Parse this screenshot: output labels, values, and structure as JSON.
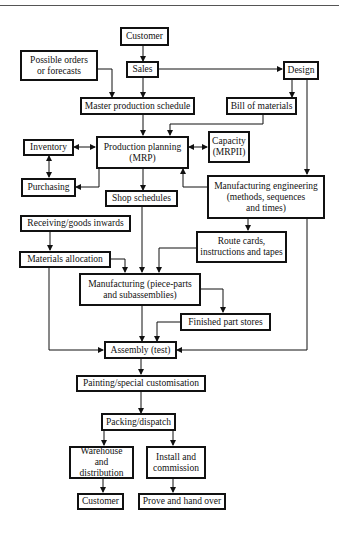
{
  "header": {
    "running_head": "…"
  },
  "diagram": {
    "nodes": {
      "customer_top": "Customer",
      "possible_orders": "Possible orders\nor forecasts",
      "sales": "Sales",
      "design": "Design",
      "master_schedule": "Master production schedule",
      "bill_of_materials": "Bill of materials",
      "inventory": "Inventory",
      "production_planning": "Production planning\n(MRP)",
      "capacity": "Capacity\n(MRPII)",
      "purchasing": "Purchasing",
      "shop_schedules": "Shop schedules",
      "mfg_engineering": "Manufacturing engineering\n(methods, sequences\nand times)",
      "receiving": "Receiving/goods inwards",
      "route_cards": "Route cards,\ninstructions and tapes",
      "materials_allocation": "Materials allocation",
      "manufacturing": "Manufacturing (piece-parts\nand subassemblies)",
      "finished_part_stores": "Finished part stores",
      "assembly": "Assembly (test)",
      "painting": "Painting/special customisation",
      "packing": "Packing/dispatch",
      "warehouse": "Warehouse and\ndistribution",
      "install": "Install and\ncommission",
      "customer_bottom": "Customer",
      "prove": "Prove and hand over"
    },
    "edges": [
      [
        "Customer",
        "Sales"
      ],
      [
        "Sales",
        "Design"
      ],
      [
        "Sales",
        "Master production schedule"
      ],
      [
        "Possible orders or forecasts",
        "Master production schedule"
      ],
      [
        "Design",
        "Bill of materials"
      ],
      [
        "Master production schedule",
        "Production planning (MRP)"
      ],
      [
        "Bill of materials",
        "Production planning (MRP)"
      ],
      [
        "Inventory",
        "Production planning (MRP)",
        "bidirectional"
      ],
      [
        "Production planning (MRP)",
        "Capacity (MRPII)",
        "bidirectional"
      ],
      [
        "Inventory",
        "Purchasing",
        "bidirectional"
      ],
      [
        "Production planning (MRP)",
        "Purchasing"
      ],
      [
        "Production planning (MRP)",
        "Shop schedules"
      ],
      [
        "Manufacturing engineering",
        "Production planning (MRP)"
      ],
      [
        "Design",
        "Manufacturing engineering"
      ],
      [
        "Manufacturing engineering",
        "Route cards"
      ],
      [
        "Receiving/goods inwards",
        "Materials allocation"
      ],
      [
        "Materials allocation",
        "Manufacturing"
      ],
      [
        "Shop schedules",
        "Manufacturing"
      ],
      [
        "Route cards",
        "Manufacturing"
      ],
      [
        "Manufacturing",
        "Finished part stores"
      ],
      [
        "Manufacturing",
        "Assembly (test)"
      ],
      [
        "Finished part stores",
        "Assembly (test)"
      ],
      [
        "Materials allocation",
        "Assembly (test)"
      ],
      [
        "Design",
        "Assembly (test)"
      ],
      [
        "Assembly (test)",
        "Painting/special customisation"
      ],
      [
        "Painting/special customisation",
        "Packing/dispatch"
      ],
      [
        "Packing/dispatch",
        "Warehouse and distribution"
      ],
      [
        "Packing/dispatch",
        "Install and commission"
      ],
      [
        "Warehouse and distribution",
        "Customer"
      ],
      [
        "Install and commission",
        "Prove and hand over"
      ]
    ]
  }
}
